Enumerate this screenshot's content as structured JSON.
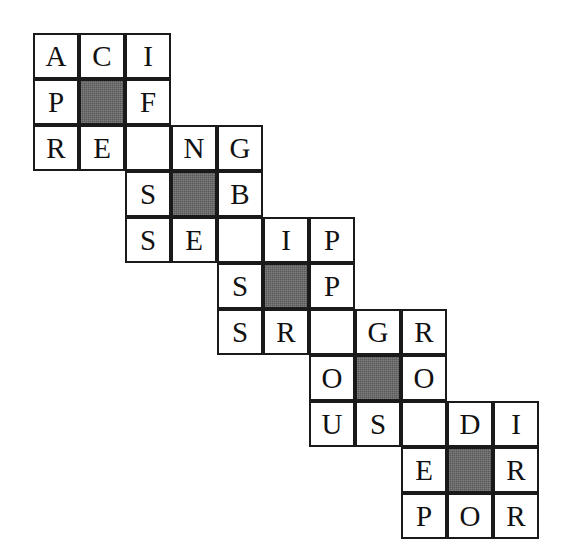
{
  "puzzle": {
    "title": "Staircase Letter Grid",
    "kind": "letter-grid-puzzle",
    "background_color": "#ffffff",
    "cell_fill_color": "#ffffff",
    "cell_border_color": "#1a1a1a",
    "shaded_cell_color": "#5a5a5a",
    "letter_color": "#111111",
    "grid": {
      "columns": 11,
      "rows": 11,
      "cell_size_px": 46,
      "origin_x_px": 33,
      "origin_y_px": 33
    },
    "cells": [
      {
        "row": 0,
        "col": 0,
        "letter": "A",
        "shaded": false
      },
      {
        "row": 0,
        "col": 1,
        "letter": "C",
        "shaded": false
      },
      {
        "row": 0,
        "col": 2,
        "letter": "I",
        "shaded": false
      },
      {
        "row": 1,
        "col": 0,
        "letter": "P",
        "shaded": false
      },
      {
        "row": 1,
        "col": 1,
        "letter": "",
        "shaded": true
      },
      {
        "row": 1,
        "col": 2,
        "letter": "F",
        "shaded": false
      },
      {
        "row": 2,
        "col": 0,
        "letter": "R",
        "shaded": false
      },
      {
        "row": 2,
        "col": 1,
        "letter": "E",
        "shaded": false
      },
      {
        "row": 2,
        "col": 2,
        "letter": "",
        "shaded": false
      },
      {
        "row": 2,
        "col": 3,
        "letter": "N",
        "shaded": false
      },
      {
        "row": 2,
        "col": 4,
        "letter": "G",
        "shaded": false
      },
      {
        "row": 3,
        "col": 2,
        "letter": "S",
        "shaded": false
      },
      {
        "row": 3,
        "col": 3,
        "letter": "",
        "shaded": true
      },
      {
        "row": 3,
        "col": 4,
        "letter": "B",
        "shaded": false
      },
      {
        "row": 4,
        "col": 2,
        "letter": "S",
        "shaded": false
      },
      {
        "row": 4,
        "col": 3,
        "letter": "E",
        "shaded": false
      },
      {
        "row": 4,
        "col": 4,
        "letter": "",
        "shaded": false
      },
      {
        "row": 4,
        "col": 5,
        "letter": "I",
        "shaded": false
      },
      {
        "row": 4,
        "col": 6,
        "letter": "P",
        "shaded": false
      },
      {
        "row": 5,
        "col": 4,
        "letter": "S",
        "shaded": false
      },
      {
        "row": 5,
        "col": 5,
        "letter": "",
        "shaded": true
      },
      {
        "row": 5,
        "col": 6,
        "letter": "P",
        "shaded": false
      },
      {
        "row": 6,
        "col": 4,
        "letter": "S",
        "shaded": false
      },
      {
        "row": 6,
        "col": 5,
        "letter": "R",
        "shaded": false
      },
      {
        "row": 6,
        "col": 6,
        "letter": "",
        "shaded": false
      },
      {
        "row": 6,
        "col": 7,
        "letter": "G",
        "shaded": false
      },
      {
        "row": 6,
        "col": 8,
        "letter": "R",
        "shaded": false
      },
      {
        "row": 7,
        "col": 6,
        "letter": "O",
        "shaded": false
      },
      {
        "row": 7,
        "col": 7,
        "letter": "",
        "shaded": true
      },
      {
        "row": 7,
        "col": 8,
        "letter": "O",
        "shaded": false
      },
      {
        "row": 8,
        "col": 6,
        "letter": "U",
        "shaded": false
      },
      {
        "row": 8,
        "col": 7,
        "letter": "S",
        "shaded": false
      },
      {
        "row": 8,
        "col": 8,
        "letter": "",
        "shaded": false
      },
      {
        "row": 8,
        "col": 9,
        "letter": "D",
        "shaded": false
      },
      {
        "row": 8,
        "col": 10,
        "letter": "I",
        "shaded": false
      },
      {
        "row": 9,
        "col": 8,
        "letter": "E",
        "shaded": false
      },
      {
        "row": 9,
        "col": 9,
        "letter": "",
        "shaded": true
      },
      {
        "row": 9,
        "col": 10,
        "letter": "R",
        "shaded": false
      },
      {
        "row": 10,
        "col": 8,
        "letter": "P",
        "shaded": false
      },
      {
        "row": 10,
        "col": 9,
        "letter": "O",
        "shaded": false
      },
      {
        "row": 10,
        "col": 10,
        "letter": "R",
        "shaded": false
      }
    ]
  }
}
